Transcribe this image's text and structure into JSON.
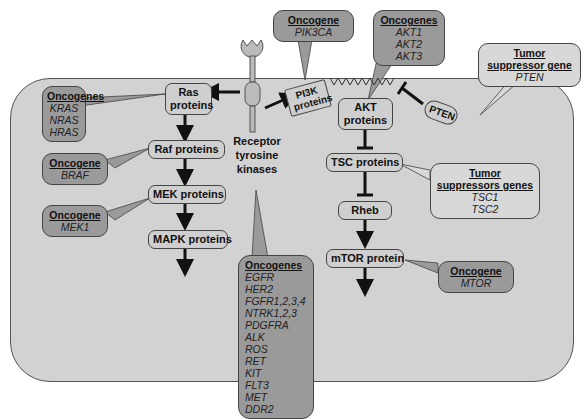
{
  "receptor": {
    "label_lines": [
      "Receptor",
      "tyrosine",
      "kinases"
    ]
  },
  "nodes": {
    "ras": [
      "Ras",
      "proteins"
    ],
    "raf": "Raf proteins",
    "mek": "MEK proteins",
    "mapk": "MAPK proteins",
    "pi3k": [
      "PI3K",
      "proteins"
    ],
    "akt": [
      "AKT",
      "proteins"
    ],
    "tsc": "TSC proteins",
    "rheb": "Rheb",
    "mtor": "mTOR protein",
    "pten": "PTEN"
  },
  "callouts": {
    "ras": {
      "heading": "Oncogenes",
      "items": [
        "KRAS",
        "NRAS",
        "HRAS"
      ]
    },
    "raf": {
      "heading": "Oncogene",
      "items": [
        "BRAF"
      ]
    },
    "mek": {
      "heading": "Oncogene",
      "items": [
        "MEK1"
      ]
    },
    "pi3k": {
      "heading": "Oncogene",
      "items": [
        "PIK3CA"
      ]
    },
    "akt": {
      "heading": "Oncogenes",
      "items": [
        "AKT1",
        "AKT2",
        "AKT3"
      ]
    },
    "pten": {
      "heading_lines": [
        "Tumor",
        "suppressor gene"
      ],
      "items": [
        "PTEN"
      ]
    },
    "tsc": {
      "heading_lines": [
        "Tumor",
        "suppressors genes"
      ],
      "items": [
        "TSC1",
        "TSC2"
      ]
    },
    "mtor": {
      "heading": "Oncogene",
      "items": [
        "MTOR"
      ]
    },
    "rtk": {
      "heading": "Oncogenes",
      "items": [
        "EGFR",
        "HER2",
        "FGFR1,2,3,4",
        "NTRK1,2,3",
        "PDGFRA",
        "ALK",
        "ROS",
        "RET",
        "KIT",
        "FLT3",
        "MET",
        "DDR2"
      ]
    }
  },
  "colors": {
    "cell_fill": "#d2d2d2",
    "oncogene_callout": "#9a9a9a",
    "suppressor_callout": "#d8d8d8",
    "node_fill": "#cfcfcf"
  }
}
